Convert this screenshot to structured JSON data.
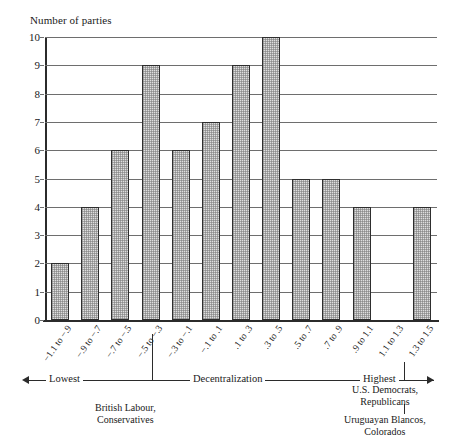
{
  "chart_data": {
    "type": "bar",
    "title": "",
    "ylabel": "Number of parties",
    "xlabel": "Decentralization",
    "ylim": [
      0,
      10
    ],
    "grid": true,
    "legend": "none",
    "yticks": [
      10,
      9,
      8,
      7,
      6,
      5,
      4,
      3,
      2,
      1,
      0
    ],
    "categories": [
      "−1.1 to −.9",
      "−.9 to −.7",
      "−.7 to −.5",
      "−.5 to −.3",
      "−.3 to −.1",
      "−.1 to .1",
      ".1 to .3",
      ".3 to .5",
      ".5 to .7",
      ".7 to .9",
      ".9 to 1.1",
      "1.1 to 1.3",
      "1.3 to 1.5"
    ],
    "values": [
      2,
      4,
      6,
      9,
      6,
      7,
      9,
      10,
      5,
      5,
      4,
      0,
      4
    ]
  },
  "axis_scale": {
    "left_label": "Lowest",
    "center_label": "Decentralization",
    "right_label": "Highest"
  },
  "annotations": [
    {
      "text_line1": "British Labour,",
      "text_line2": "Conservatives",
      "points_to_category": "−.5 to −.3"
    },
    {
      "text_line1": "U.S. Democrats,",
      "text_line2": "Republicans",
      "points_to_category": "1.3 to 1.5"
    },
    {
      "text_line1": "Uruguayan Blancos,",
      "text_line2": "Colorados",
      "points_to_category": "1.3 to 1.5"
    }
  ],
  "colors": {
    "bar_fill": "#dedede",
    "bar_border": "#2e2e2e",
    "axis": "#2b2b2b",
    "gridline": "#6e6e6e",
    "background": "#ffffff"
  }
}
